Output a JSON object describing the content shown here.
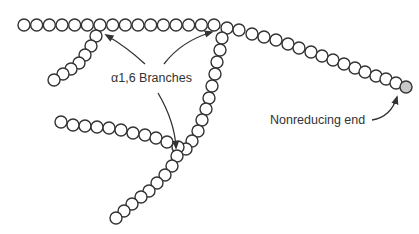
{
  "diagram": {
    "labels": {
      "branches": "α1,6 Branches",
      "nonreducing_end": "Nonreducing end"
    },
    "colors": {
      "stroke": "#333333",
      "unit_fill": "#ffffff",
      "nonreducing_fill": "#c8c8c8"
    },
    "unit_radius": 6,
    "chains": [
      {
        "name": "main-chain",
        "from": [
          24,
          25
        ],
        "to": [
          214,
          25
        ],
        "count": 16
      },
      {
        "name": "main-chain-descending",
        "from": [
          227,
          28
        ],
        "to": [
          422,
          89
        ],
        "count": 17,
        "curve": [
          [
            227,
            28
          ],
          [
            239,
            30
          ],
          [
            252,
            34
          ],
          [
            264,
            37
          ],
          [
            276,
            40
          ],
          [
            288,
            44
          ],
          [
            299,
            48
          ],
          [
            311,
            52
          ],
          [
            322,
            56
          ],
          [
            333,
            60
          ],
          [
            344,
            64
          ],
          [
            355,
            68
          ],
          [
            365,
            72
          ],
          [
            376,
            76
          ],
          [
            386,
            79
          ],
          [
            396,
            83
          ],
          [
            406,
            87
          ]
        ]
      },
      {
        "name": "branch-1",
        "points": [
          [
            96,
            36
          ],
          [
            91,
            46
          ],
          [
            85,
            55
          ],
          [
            79,
            63
          ],
          [
            71,
            69
          ],
          [
            63,
            74
          ],
          [
            54,
            80
          ]
        ]
      },
      {
        "name": "branch-2",
        "points": [
          [
            222,
            38
          ],
          [
            220,
            50
          ],
          [
            217,
            62
          ],
          [
            215,
            74
          ],
          [
            212,
            86
          ],
          [
            209,
            98
          ],
          [
            206,
            109
          ],
          [
            202,
            120
          ],
          [
            198,
            131
          ],
          [
            192,
            141
          ],
          [
            186,
            149
          ]
        ]
      },
      {
        "name": "branch-3",
        "points": [
          [
            61,
            122
          ],
          [
            73,
            125
          ],
          [
            85,
            126
          ],
          [
            97,
            127
          ],
          [
            109,
            128
          ],
          [
            121,
            130
          ],
          [
            133,
            133
          ],
          [
            145,
            135
          ],
          [
            156,
            138
          ],
          [
            167,
            142
          ],
          [
            178,
            147
          ]
        ]
      },
      {
        "name": "branch-4",
        "points": [
          [
            177,
            156
          ],
          [
            172,
            166
          ],
          [
            165,
            175
          ],
          [
            157,
            183
          ],
          [
            149,
            191
          ],
          [
            141,
            197
          ],
          [
            132,
            204
          ],
          [
            124,
            211
          ],
          [
            116,
            218
          ]
        ]
      }
    ],
    "nonreducing_unit": [
      406,
      87
    ],
    "arrows": [
      {
        "name": "arrow-to-branch-1",
        "path": "M145,64 C130,50 118,42 106,35",
        "head": [
          106,
          35
        ]
      },
      {
        "name": "arrow-to-branch-2",
        "path": "M164,64 C176,48 192,38 212,32",
        "head": [
          212,
          32
        ]
      },
      {
        "name": "arrow-to-branch-3",
        "path": "M158,93 C168,110 175,128 176,148",
        "head": [
          176,
          148
        ]
      },
      {
        "name": "arrow-to-nonreducing-end",
        "path": "M372,120 C385,118 393,110 397,97",
        "head": [
          397,
          97
        ]
      }
    ],
    "label_positions": {
      "branches": [
        111,
        82
      ],
      "nonreducing_end": [
        270,
        124
      ]
    }
  }
}
